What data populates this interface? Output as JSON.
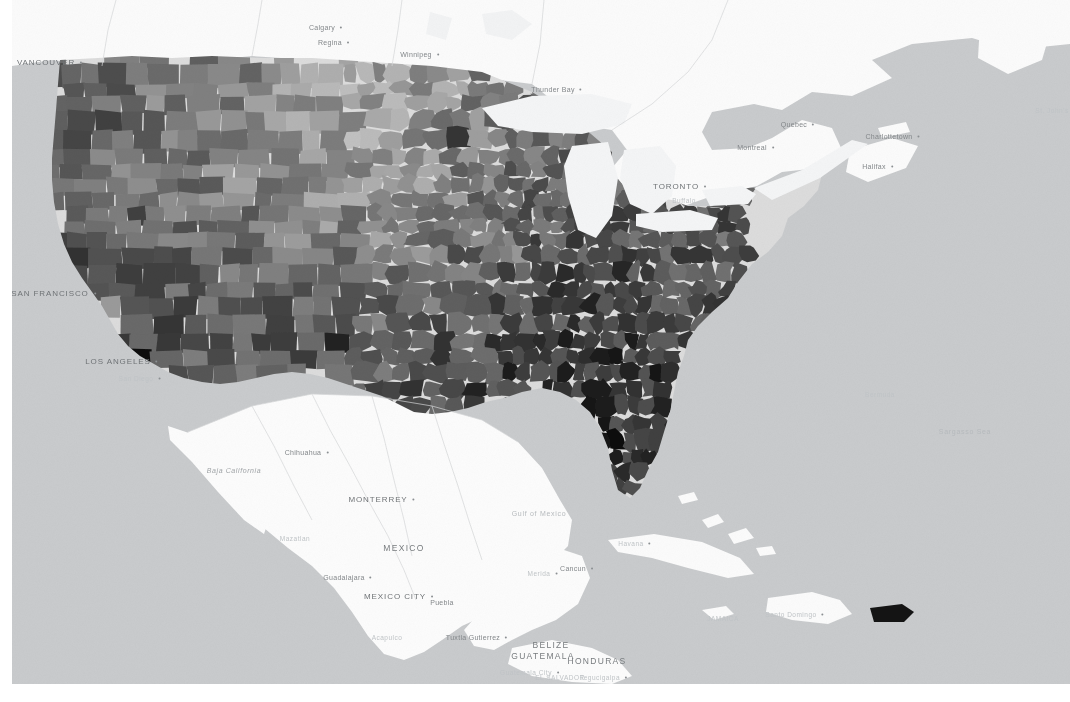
{
  "map": {
    "title": "United States county-level choropleth map",
    "basemap_style": "light-gray",
    "colors": {
      "ocean": "#c9cbcd",
      "land_outside": "#fcfcfc",
      "land_border": "#d8dadc",
      "choropleth_min": "#e8e8e8",
      "choropleth_max": "#0d0d0d",
      "label": "#7d8184"
    },
    "labels": [
      {
        "text": "VANCOUVER",
        "x": 34,
        "y": 62,
        "kind": "city-major",
        "dot": true
      },
      {
        "text": "Calgary",
        "x": 310,
        "y": 27,
        "kind": "city",
        "dot": true
      },
      {
        "text": "Regina",
        "x": 318,
        "y": 42,
        "kind": "city",
        "dot": true
      },
      {
        "text": "Winnipeg",
        "x": 404,
        "y": 54,
        "kind": "city",
        "dot": true
      },
      {
        "text": "Thunder Bay",
        "x": 541,
        "y": 89,
        "kind": "city",
        "dot": true
      },
      {
        "text": "TORONTO",
        "x": 664,
        "y": 186,
        "kind": "city-major",
        "dot": true
      },
      {
        "text": "Buffalo",
        "x": 672,
        "y": 200,
        "kind": "faint",
        "dot": false
      },
      {
        "text": "Montreal",
        "x": 740,
        "y": 147,
        "kind": "city",
        "dot": true
      },
      {
        "text": "Quebec",
        "x": 782,
        "y": 124,
        "kind": "city",
        "dot": true
      },
      {
        "text": "Charlottetown",
        "x": 877,
        "y": 136,
        "kind": "city",
        "dot": true
      },
      {
        "text": "Halifax",
        "x": 862,
        "y": 166,
        "kind": "city",
        "dot": true
      },
      {
        "text": "St. John's",
        "x": 1040,
        "y": 110,
        "kind": "faint",
        "dot": true
      },
      {
        "text": "SAN FRANCISCO",
        "x": 38,
        "y": 293,
        "kind": "city-major",
        "dot": true
      },
      {
        "text": "LOS ANGELES",
        "x": 106,
        "y": 361,
        "kind": "city-major",
        "dot": true
      },
      {
        "text": "San Diego",
        "x": 124,
        "y": 378,
        "kind": "faint",
        "dot": true
      },
      {
        "text": "Chihuahua",
        "x": 291,
        "y": 452,
        "kind": "city",
        "dot": true
      },
      {
        "text": "Baja California",
        "x": 222,
        "y": 470,
        "kind": "region",
        "dot": false
      },
      {
        "text": "MONTERREY",
        "x": 366,
        "y": 499,
        "kind": "city-major",
        "dot": true
      },
      {
        "text": "Mazatlan",
        "x": 283,
        "y": 538,
        "kind": "faint",
        "dot": false
      },
      {
        "text": "MEXICO",
        "x": 392,
        "y": 548,
        "kind": "country",
        "dot": false
      },
      {
        "text": "Guadalajara",
        "x": 332,
        "y": 577,
        "kind": "city",
        "dot": true
      },
      {
        "text": "MEXICO CITY",
        "x": 383,
        "y": 596,
        "kind": "city-major",
        "dot": true
      },
      {
        "text": "Puebla",
        "x": 430,
        "y": 602,
        "kind": "city",
        "dot": false
      },
      {
        "text": "Acapulco",
        "x": 375,
        "y": 637,
        "kind": "faint",
        "dot": false
      },
      {
        "text": "Tuxtla Gutierrez",
        "x": 461,
        "y": 637,
        "kind": "city",
        "dot": true
      },
      {
        "text": "BELIZE",
        "x": 539,
        "y": 645,
        "kind": "country",
        "dot": false
      },
      {
        "text": "GUATEMALA",
        "x": 531,
        "y": 656,
        "kind": "country",
        "dot": false
      },
      {
        "text": "HONDURAS",
        "x": 585,
        "y": 661,
        "kind": "country",
        "dot": false
      },
      {
        "text": "Guatemala City",
        "x": 514,
        "y": 672,
        "kind": "faint",
        "dot": true
      },
      {
        "text": "Tegucigalpa",
        "x": 588,
        "y": 677,
        "kind": "faint",
        "dot": true
      },
      {
        "text": "EL SALVADOR",
        "x": 548,
        "y": 677,
        "kind": "faint",
        "dot": false
      },
      {
        "text": "Cancun",
        "x": 561,
        "y": 568,
        "kind": "city",
        "dot": true
      },
      {
        "text": "Merida",
        "x": 527,
        "y": 573,
        "kind": "faint",
        "dot": true
      },
      {
        "text": "Havana",
        "x": 619,
        "y": 543,
        "kind": "faint",
        "dot": true
      },
      {
        "text": "Santo Domingo",
        "x": 779,
        "y": 614,
        "kind": "faint",
        "dot": true
      },
      {
        "text": "JAMAICA",
        "x": 711,
        "y": 618,
        "kind": "faint",
        "dot": false
      },
      {
        "text": "Gulf of Mexico",
        "x": 527,
        "y": 513,
        "kind": "water",
        "dot": false
      },
      {
        "text": "Bermuda",
        "x": 868,
        "y": 394,
        "kind": "faint",
        "dot": false
      },
      {
        "text": "Sargasso Sea",
        "x": 953,
        "y": 431,
        "kind": "water",
        "dot": false
      }
    ]
  },
  "chart_data": {
    "type": "heatmap",
    "geography": "US counties",
    "colormap": "grayscale (light = low, dark = high)",
    "legend": null,
    "regions": [
      {
        "name": "Pacific Northwest (WA/OR)",
        "shade": "mixed-dark",
        "value": 0.62
      },
      {
        "name": "California coast",
        "shade": "dark",
        "value": 0.74
      },
      {
        "name": "Nevada / Arizona / New Mexico",
        "shade": "very-dark",
        "value": 0.88
      },
      {
        "name": "Rocky Mountains (MT/ID/WY)",
        "shade": "mixed",
        "value": 0.48
      },
      {
        "name": "Great Plains (ND/SD/NE/KS)",
        "shade": "very-light",
        "value": 0.16
      },
      {
        "name": "Texas panhandle / west Texas",
        "shade": "mixed-dark",
        "value": 0.58
      },
      {
        "name": "South Texas border",
        "shade": "very-dark",
        "value": 0.86
      },
      {
        "name": "Corn belt (IA/IL/IN/OH)",
        "shade": "light",
        "value": 0.28
      },
      {
        "name": "Northern Michigan / UP",
        "shade": "very-dark",
        "value": 0.85
      },
      {
        "name": "Appalachia (KY/WV/TN)",
        "shade": "dark",
        "value": 0.8
      },
      {
        "name": "Deep South (MS/AL/GA/SC)",
        "shade": "very-dark",
        "value": 0.87
      },
      {
        "name": "Mississippi Delta / Arkansas",
        "shade": "dark",
        "value": 0.79
      },
      {
        "name": "Florida peninsula",
        "shade": "very-dark",
        "value": 0.84
      },
      {
        "name": "Mid-Atlantic (VA/NC)",
        "shade": "dark",
        "value": 0.7
      },
      {
        "name": "Northeast corridor (NY/NJ/PA)",
        "shade": "mixed",
        "value": 0.52
      },
      {
        "name": "Maine",
        "shade": "very-dark",
        "value": 0.83
      },
      {
        "name": "Puerto Rico",
        "shade": "very-dark",
        "value": 0.92
      }
    ]
  }
}
